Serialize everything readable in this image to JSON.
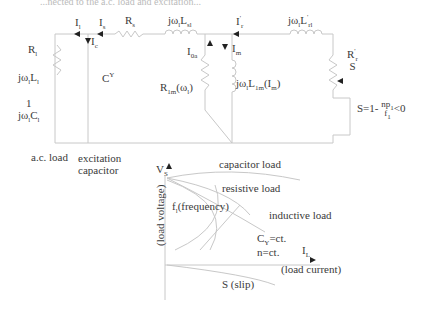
{
  "title": "...nected to the a.c. load and excitation...",
  "circuit": {
    "currents": {
      "I1": {
        "main": "I",
        "sub": "l"
      },
      "Is": {
        "main": "I",
        "sub": "s"
      },
      "Ic": {
        "main": "I",
        "sub": "c"
      },
      "I0a": {
        "main": "I",
        "sub": "0a"
      },
      "Im": {
        "main": "I",
        "sub": "m"
      },
      "Ir": {
        "main": "I",
        "sup": "'",
        "sub": "r"
      }
    },
    "components": {
      "Rs": {
        "main": "R",
        "sub": "s"
      },
      "Lsl": {
        "pre": "jω",
        "sub1": "l",
        "main": "L",
        "sub2": "sl"
      },
      "Lrl": {
        "pre": "jω",
        "sub1": "l",
        "main": "L",
        "sup": "'",
        "sub2": "rl"
      },
      "R1m": {
        "main": "R",
        "sub": "1m",
        "arg": "(ω",
        "argsub": "l",
        "argend": ")"
      },
      "L1m": {
        "pre": "jω",
        "sub1": "l",
        "main": "L",
        "sub2": "1m",
        "arg": "(I",
        "argsub": "m",
        "argend": ")"
      },
      "Rr_over_S": {
        "num_main": "R",
        "num_sup": "'",
        "num_sub": "r",
        "den": "S"
      },
      "Rl": {
        "main": "R",
        "sub": "l"
      },
      "Ll": {
        "pre": "jω",
        "sub1": "l",
        "main": "L",
        "sub2": "l"
      },
      "Cl": {
        "num": "1",
        "pre": "jω",
        "sub1": "l",
        "main": "C",
        "sub2": "l"
      },
      "Cy": {
        "main": "C",
        "sup": "Y"
      }
    },
    "slip_formula": {
      "lhs": "S=1-",
      "num": "np",
      "num_sub": "1",
      "den": "f",
      "den_sub": "1",
      "rhs": "<0"
    },
    "captions": {
      "ac_load": "a.c. load",
      "excitation_capacitor_line1": "excitation",
      "excitation_capacitor_line2": "capacitor"
    }
  },
  "characteristic": {
    "y_axis": {
      "symbol": "V",
      "symbol_sub": "S",
      "label": "(load voltage)"
    },
    "x_axis": {
      "symbol": "I",
      "symbol_sub": "L",
      "label": "(load current)"
    },
    "curves": [
      "capacitor load",
      "resistive load",
      "inductive load"
    ],
    "frequency_label": {
      "main": "f",
      "sub": "l",
      "rest": "(frequency)"
    },
    "slip_label": "S (slip)",
    "conditions": [
      {
        "main": "C",
        "sub": "Y",
        "rest": "=ct."
      },
      {
        "main": "n=ct."
      }
    ]
  },
  "colors": {
    "line": "#c8c8c8",
    "text": "#3a3a3a",
    "arrow": "#222222"
  }
}
